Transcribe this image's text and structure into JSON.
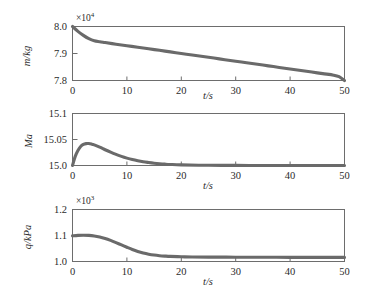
{
  "figure": {
    "curve_color": "#6a6a6a",
    "axis_color": "#6d6d6d",
    "xlabel": "t/s"
  },
  "chart_data": [
    {
      "type": "line",
      "id": "mass",
      "title": "",
      "xlabel": "t/s",
      "ylabel": "m/kg",
      "y_multiplier": "×10",
      "y_multiplier_exp": "4",
      "xlim": [
        0,
        50
      ],
      "ylim": [
        7.8,
        8.0
      ],
      "xticks": [
        0,
        10,
        20,
        30,
        40,
        50
      ],
      "xticklabels": [
        "0",
        "10",
        "20",
        "30",
        "40",
        "50"
      ],
      "yticks": [
        7.8,
        7.9,
        8.0
      ],
      "yticklabels": [
        "7.8",
        "7.9",
        "8.0"
      ],
      "grid": false,
      "legend": false,
      "x": [
        0,
        1,
        2,
        3,
        4,
        5,
        6,
        8,
        10,
        12,
        14,
        16,
        18,
        20,
        22,
        24,
        26,
        28,
        30,
        32,
        34,
        36,
        38,
        40,
        42,
        44,
        46,
        48,
        49,
        50
      ],
      "values": [
        8.0,
        7.982,
        7.967,
        7.955,
        7.947,
        7.9435,
        7.9405,
        7.9345,
        7.929,
        7.9232,
        7.9175,
        7.9118,
        7.906,
        7.9002,
        7.8945,
        7.8888,
        7.883,
        7.8772,
        7.8715,
        7.8658,
        7.86,
        7.8542,
        7.8485,
        7.8428,
        7.837,
        7.8312,
        7.8255,
        7.8198,
        7.814,
        7.8
      ]
    },
    {
      "type": "line",
      "id": "mach",
      "title": "",
      "xlabel": "t/s",
      "ylabel": "Ma",
      "y_multiplier": "",
      "y_multiplier_exp": "",
      "xlim": [
        0,
        50
      ],
      "ylim": [
        15.0,
        15.1
      ],
      "xticks": [
        0,
        10,
        20,
        30,
        40,
        50
      ],
      "xticklabels": [
        "0",
        "10",
        "20",
        "30",
        "40",
        "50"
      ],
      "yticks": [
        15.0,
        15.05,
        15.1
      ],
      "yticklabels": [
        "15.0",
        "15.05",
        "15.1"
      ],
      "grid": false,
      "legend": false,
      "x": [
        0,
        0.5,
        1,
        1.5,
        2,
        2.5,
        3,
        3.5,
        4,
        5,
        6,
        7,
        8,
        9,
        10,
        11,
        12,
        13,
        14,
        15,
        16,
        17,
        18,
        20,
        25,
        30,
        35,
        40,
        45,
        50
      ],
      "values": [
        15.0,
        15.0175,
        15.029,
        15.0365,
        15.0405,
        15.0421,
        15.0422,
        15.0412,
        15.0396,
        15.0352,
        15.0303,
        15.0256,
        15.0213,
        15.0175,
        15.0142,
        15.0114,
        15.0091,
        15.0072,
        15.0057,
        15.0044,
        15.0034,
        15.0026,
        15.002,
        15.0012,
        15.0004,
        15.0002,
        15.0001,
        15.0,
        15.0,
        15.0
      ]
    },
    {
      "type": "line",
      "id": "dynamic-pressure",
      "title": "",
      "xlabel": "t/s",
      "ylabel": "q/kPa",
      "y_multiplier": "×10",
      "y_multiplier_exp": "3",
      "xlim": [
        0,
        50
      ],
      "ylim": [
        1.0,
        1.2
      ],
      "xticks": [
        0,
        10,
        20,
        30,
        40,
        50
      ],
      "xticklabels": [
        "0",
        "10",
        "20",
        "30",
        "40",
        "50"
      ],
      "yticks": [
        1.0,
        1.1,
        1.2
      ],
      "yticklabels": [
        "1.0",
        "1.1",
        "1.2"
      ],
      "grid": false,
      "legend": false,
      "x": [
        0,
        1,
        2,
        3,
        4,
        5,
        6,
        7,
        8,
        9,
        10,
        11,
        12,
        13,
        14,
        15,
        16,
        17,
        18,
        20,
        22,
        25,
        30,
        35,
        40,
        45,
        50
      ],
      "values": [
        1.0985,
        1.1005,
        1.1012,
        1.1005,
        1.0982,
        1.0942,
        1.0885,
        1.0812,
        1.0728,
        1.0638,
        1.0548,
        1.0462,
        1.0388,
        1.0328,
        1.0282,
        1.0248,
        1.0224,
        1.0208,
        1.0196,
        1.0182,
        1.0175,
        1.017,
        1.0165,
        1.0162,
        1.016,
        1.0158,
        1.0157
      ]
    }
  ]
}
